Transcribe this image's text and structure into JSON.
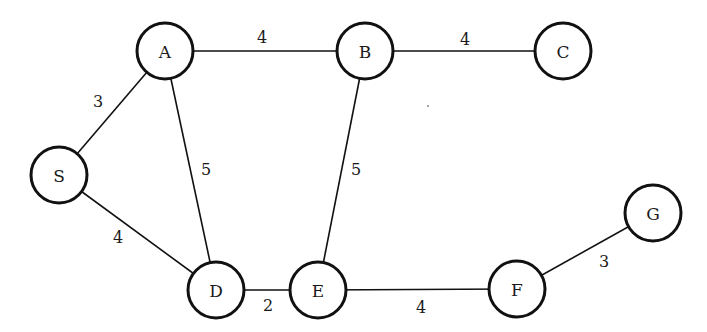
{
  "diagram": {
    "type": "weighted-undirected-graph",
    "colors": {
      "stroke": "#111111",
      "text": "#1a1a1a",
      "background": "#ffffff"
    },
    "nodes": [
      {
        "id": "A",
        "label": "A",
        "x": 165,
        "y": 51
      },
      {
        "id": "B",
        "label": "B",
        "x": 365,
        "y": 51
      },
      {
        "id": "C",
        "label": "C",
        "x": 563,
        "y": 51
      },
      {
        "id": "S",
        "label": "S",
        "x": 59,
        "y": 175
      },
      {
        "id": "D",
        "label": "D",
        "x": 216,
        "y": 290
      },
      {
        "id": "E",
        "label": "E",
        "x": 318,
        "y": 290
      },
      {
        "id": "F",
        "label": "F",
        "x": 517,
        "y": 289
      },
      {
        "id": "G",
        "label": "G",
        "x": 653,
        "y": 213
      }
    ],
    "edges": [
      {
        "from": "A",
        "to": "B",
        "weight": "4",
        "lx": 262,
        "ly": 37
      },
      {
        "from": "B",
        "to": "C",
        "weight": "4",
        "lx": 465,
        "ly": 39
      },
      {
        "from": "S",
        "to": "A",
        "weight": "3",
        "lx": 98,
        "ly": 101
      },
      {
        "from": "A",
        "to": "D",
        "weight": "5",
        "lx": 206,
        "ly": 169
      },
      {
        "from": "B",
        "to": "E",
        "weight": "5",
        "lx": 356,
        "ly": 169
      },
      {
        "from": "S",
        "to": "D",
        "weight": "4",
        "lx": 118,
        "ly": 237
      },
      {
        "from": "D",
        "to": "E",
        "weight": "2",
        "lx": 268,
        "ly": 305
      },
      {
        "from": "E",
        "to": "F",
        "weight": "4",
        "lx": 421,
        "ly": 307
      },
      {
        "from": "F",
        "to": "G",
        "weight": "3",
        "lx": 604,
        "ly": 261
      }
    ],
    "node_radius": 28
  }
}
